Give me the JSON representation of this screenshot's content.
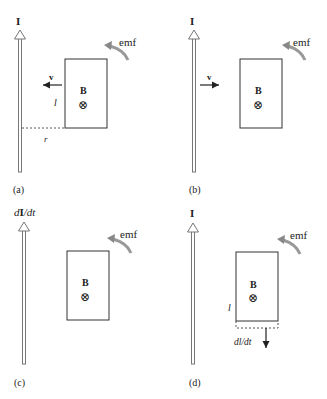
{
  "figure": {
    "panels": [
      {
        "id": "a",
        "caption": "(a)",
        "current_label": "I",
        "field_label": "B",
        "field_symbol": "⊗",
        "emf_label": "emf",
        "velocity_label": "v",
        "velocity_direction": "left",
        "length_label": "l",
        "distance_label": "r"
      },
      {
        "id": "b",
        "caption": "(b)",
        "current_label": "I",
        "field_label": "B",
        "field_symbol": "⊗",
        "emf_label": "emf",
        "velocity_label": "v",
        "velocity_direction": "right"
      },
      {
        "id": "c",
        "caption": "(c)",
        "current_label_prefix": "d",
        "current_label_bold": "I",
        "current_label_suffix": "/dt",
        "field_label": "B",
        "field_symbol": "⊗",
        "emf_label": "emf"
      },
      {
        "id": "d",
        "caption": "(d)",
        "current_label": "I",
        "field_label": "B",
        "field_symbol": "⊗",
        "emf_label": "emf",
        "length_label": "l",
        "rate_label": "dl/dt"
      }
    ],
    "colors": {
      "line": "#333333",
      "wire": "#777777",
      "emf_arrow": "#8a8a8a",
      "dashed": "#555555"
    }
  }
}
